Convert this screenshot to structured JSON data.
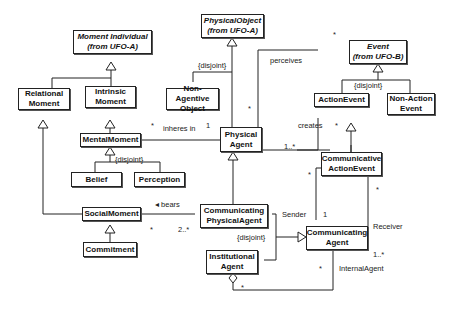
{
  "classes": {
    "moment_individual": {
      "line1": "Moment Individual",
      "line2": "(from UFO-A)"
    },
    "physical_object": {
      "line1": "PhysicalObject",
      "line2": "(from UFO-A)"
    },
    "event": {
      "line1": "Event",
      "line2": "(from UFO-B)"
    },
    "relational_moment": {
      "line1": "Relational",
      "line2": "Moment"
    },
    "intrinsic_moment": {
      "line1": "Intrinsic",
      "line2": "Moment"
    },
    "non_agentive_object": {
      "line1": "Non-Agentive",
      "line2": "Object"
    },
    "action_event": {
      "line1": "ActionEvent"
    },
    "non_action_event": {
      "line1": "Non-Action",
      "line2": "Event"
    },
    "mental_moment": {
      "line1": "MentalMoment"
    },
    "physical_agent": {
      "line1": "Physical",
      "line2": "Agent"
    },
    "belief": {
      "line1": "Belief"
    },
    "perception": {
      "line1": "Perception"
    },
    "communicative_action_event": {
      "line1": "Communicative",
      "line2": "ActionEvent"
    },
    "social_moment": {
      "line1": "SocialMoment"
    },
    "communicating_physical_agent": {
      "line1": "Communicating",
      "line2": "PhysicalAgent"
    },
    "commitment": {
      "line1": "Commitment"
    },
    "institutional_agent": {
      "line1": "Institutional",
      "line2": "Agent"
    },
    "communicating_agent": {
      "line1": "Communicating",
      "line2": "Agent"
    }
  },
  "labels": {
    "disjoint_physical_object": "{disjoint}",
    "disjoint_event": "{disjoint}",
    "disjoint_mental": "{disjoint}",
    "disjoint_agent": "{disjoint}",
    "perceives": "perceives",
    "perceives_mult": "*",
    "perceives_mult_agent": "*",
    "inheres_in": "inheres in",
    "inheres_mult_many": "*",
    "inheres_mult_one": "1",
    "creates": "creates",
    "creates_mult_event": "*",
    "creates_mult_agent": "1..*",
    "bears": "◂ bears",
    "bears_mult_moment": "*",
    "bears_mult_agent": "2..*",
    "sender": "Sender",
    "sender_mult": "1",
    "sender_event_mult": "*",
    "receiver": "Receiver",
    "receiver_mult": "1..*",
    "receiver_event_mult": "*",
    "internal_agent": "InternalAgent",
    "internal_mult": "*",
    "internal_mult_inst": "*"
  }
}
